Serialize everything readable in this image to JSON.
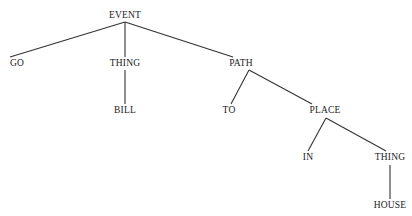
{
  "tree": {
    "nodes": [
      {
        "id": "event",
        "label": "EVENT",
        "x": 125,
        "y": 16
      },
      {
        "id": "go",
        "label": "GO",
        "x": 17,
        "y": 64
      },
      {
        "id": "thing1",
        "label": "THING",
        "x": 125,
        "y": 64
      },
      {
        "id": "bill",
        "label": "BILL",
        "x": 125,
        "y": 111
      },
      {
        "id": "path",
        "label": "PATH",
        "x": 241,
        "y": 64
      },
      {
        "id": "to",
        "label": "TO",
        "x": 229,
        "y": 111
      },
      {
        "id": "place",
        "label": "PLACE",
        "x": 325,
        "y": 111
      },
      {
        "id": "in",
        "label": "IN",
        "x": 308,
        "y": 158
      },
      {
        "id": "thing2",
        "label": "THING",
        "x": 390,
        "y": 158
      },
      {
        "id": "house",
        "label": "HOUSE",
        "x": 390,
        "y": 206
      }
    ],
    "edges": [
      [
        "event",
        "go"
      ],
      [
        "event",
        "thing1"
      ],
      [
        "event",
        "path"
      ],
      [
        "thing1",
        "bill"
      ],
      [
        "path",
        "to"
      ],
      [
        "path",
        "place"
      ],
      [
        "place",
        "in"
      ],
      [
        "place",
        "thing2"
      ],
      [
        "thing2",
        "house"
      ]
    ]
  }
}
